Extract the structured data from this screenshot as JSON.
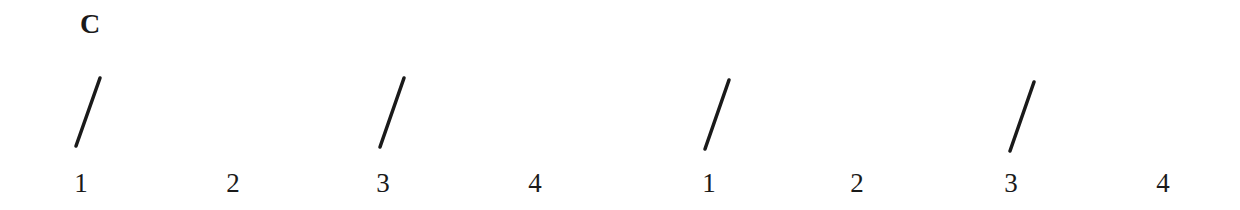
{
  "panel_label": "C",
  "stroke_color": "#1a1a1a",
  "groups": [
    {
      "beats": [
        {
          "label": "1",
          "x": 81,
          "mark": true,
          "slash": {
            "x1": 76,
            "y1": 146,
            "x2": 100,
            "y2": 78
          }
        },
        {
          "label": "2",
          "x": 233,
          "mark": false
        },
        {
          "label": "3",
          "x": 383,
          "mark": true,
          "slash": {
            "x1": 380,
            "y1": 147,
            "x2": 404,
            "y2": 78
          }
        },
        {
          "label": "4",
          "x": 535,
          "mark": false
        }
      ]
    },
    {
      "beats": [
        {
          "label": "1",
          "x": 709,
          "mark": true,
          "slash": {
            "x1": 705,
            "y1": 149,
            "x2": 729,
            "y2": 80
          }
        },
        {
          "label": "2",
          "x": 857,
          "mark": false
        },
        {
          "label": "3",
          "x": 1011,
          "mark": true,
          "slash": {
            "x1": 1010,
            "y1": 151,
            "x2": 1034,
            "y2": 82
          }
        },
        {
          "label": "4",
          "x": 1163,
          "mark": false
        }
      ]
    }
  ]
}
